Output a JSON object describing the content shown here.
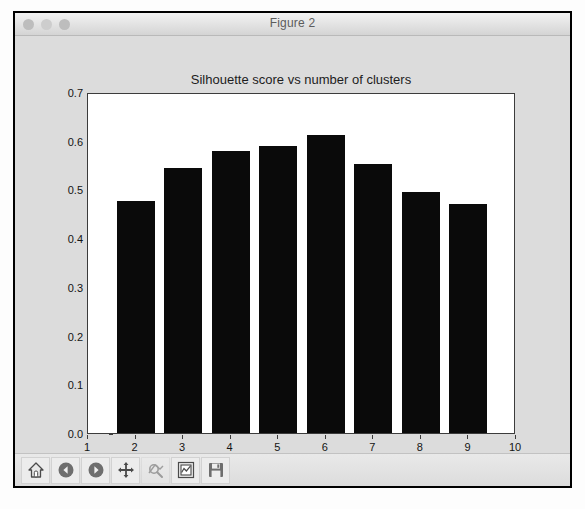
{
  "window": {
    "title": "Figure 2",
    "traffic_lights": [
      "close-button",
      "minimize-button",
      "zoom-button"
    ]
  },
  "toolbar": {
    "buttons": [
      {
        "name": "home-icon",
        "label": "Home"
      },
      {
        "name": "back-arrow-icon",
        "label": "Back"
      },
      {
        "name": "forward-arrow-icon",
        "label": "Forward"
      },
      {
        "name": "pan-move-icon",
        "label": "Pan"
      },
      {
        "name": "zoom-rect-icon",
        "label": "Zoom to rectangle"
      },
      {
        "name": "subplots-config-icon",
        "label": "Configure subplots"
      },
      {
        "name": "save-floppy-icon",
        "label": "Save figure"
      }
    ]
  },
  "chart_data": {
    "type": "bar",
    "title": "Silhouette score vs number of clusters",
    "xlabel": "",
    "ylabel": "",
    "categories": [
      2,
      3,
      4,
      5,
      6,
      7,
      8,
      9
    ],
    "values": [
      0.477,
      0.545,
      0.578,
      0.59,
      0.612,
      0.553,
      0.495,
      0.47
    ],
    "xlim": [
      1,
      10
    ],
    "ylim": [
      0.0,
      0.7
    ],
    "xticks": [
      1,
      2,
      3,
      4,
      5,
      6,
      7,
      8,
      9,
      10
    ],
    "xticklabels": [
      "1",
      "2",
      "3",
      "4",
      "5",
      "6",
      "7",
      "8",
      "9",
      "10"
    ],
    "yticks": [
      0.0,
      0.1,
      0.2,
      0.3,
      0.4,
      0.5,
      0.6,
      0.7
    ],
    "yticklabels": [
      "0.0",
      "0.1",
      "0.2",
      "0.3",
      "0.4",
      "0.5",
      "0.6",
      "0.7"
    ],
    "grid": false,
    "legend": null,
    "bar_color": "#0a0a0a",
    "bar_width": 0.8,
    "background": "#ffffff"
  }
}
